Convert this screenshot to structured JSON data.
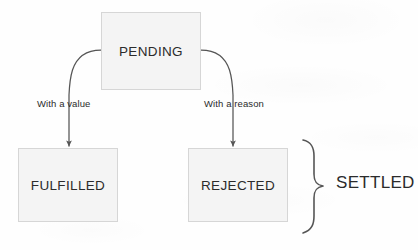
{
  "diagram": {
    "type": "state-flow-diagram",
    "colors": {
      "background": "#fefefe",
      "box_fill": "#f4f4f4",
      "box_border": "#d6d6d6",
      "stroke": "#555555",
      "text": "#2b2b2b"
    },
    "nodes": [
      {
        "id": "pending",
        "label": "PENDING"
      },
      {
        "id": "fulfilled",
        "label": "FULFILLED"
      },
      {
        "id": "rejected",
        "label": "REJECTED"
      }
    ],
    "edges": [
      {
        "id": "pending-to-fulfilled",
        "from": "pending",
        "to": "fulfilled",
        "label": "With a value"
      },
      {
        "id": "pending-to-rejected",
        "from": "pending",
        "to": "rejected",
        "label": "With a reason"
      }
    ],
    "grouping": {
      "id": "settled",
      "label": "SETTLED",
      "members": [
        "fulfilled",
        "rejected"
      ],
      "bracket": "curly-brace-right"
    }
  }
}
